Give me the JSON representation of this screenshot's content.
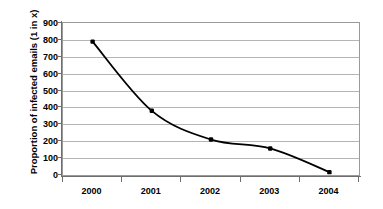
{
  "chart_data": {
    "type": "line",
    "title": "",
    "xlabel": "",
    "ylabel": "Proportion of infected emails (1 in x)",
    "categories": [
      "2000",
      "2001",
      "2002",
      "2003",
      "2004"
    ],
    "values": [
      790,
      380,
      210,
      157,
      17
    ],
    "series": [
      {
        "name": "Proportion of infected emails (1 in x)",
        "values": [
          790,
          380,
          210,
          157,
          17
        ]
      }
    ],
    "ylim": [
      0,
      900
    ],
    "ytick_labels": [
      "900",
      "800",
      "700",
      "600",
      "500",
      "400",
      "300",
      "200",
      "100",
      "0"
    ],
    "ytick_values": [
      900,
      800,
      700,
      600,
      500,
      400,
      300,
      200,
      100,
      0
    ],
    "xtick_labels": [
      "2000",
      "2001",
      "2002",
      "2003",
      "2004"
    ],
    "grid": "horizontal",
    "legend": "none",
    "line_color": "#000000",
    "marker_color": "#000000",
    "gridline_color": "#b5b5b5",
    "axis_color": "#6e6e6e",
    "plot_background": "#ffffff",
    "smoothing": "smooth"
  }
}
